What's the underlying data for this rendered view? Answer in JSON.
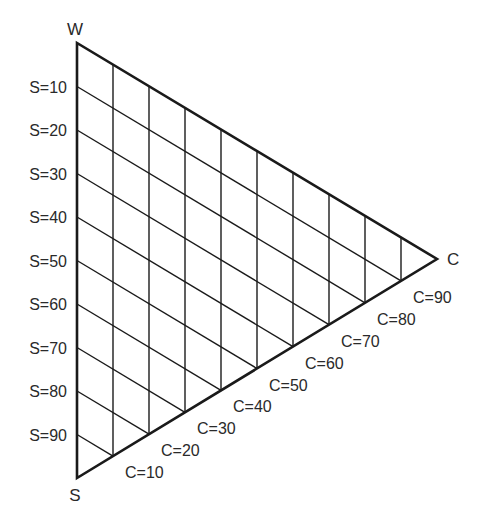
{
  "diagram": {
    "type": "ternary-triangle",
    "vertices": {
      "white": {
        "label": "W",
        "x": 77,
        "y": 43
      },
      "black": {
        "label": "S",
        "x": 77,
        "y": 478
      },
      "color": {
        "label": "C",
        "x": 437,
        "y": 259
      }
    },
    "s_labels": [
      "S=10",
      "S=20",
      "S=30",
      "S=40",
      "S=50",
      "S=60",
      "S=70",
      "S=80",
      "S=90"
    ],
    "c_labels": [
      "C=10",
      "C=20",
      "C=30",
      "C=40",
      "C=50",
      "C=60",
      "C=70",
      "C=80",
      "C=90"
    ],
    "divisions": 10,
    "colors": {
      "line": "#1a1a1a",
      "text": "#2a2a2a",
      "background": "#ffffff"
    }
  }
}
